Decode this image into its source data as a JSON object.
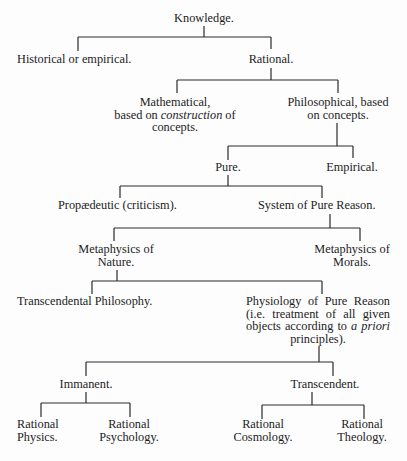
{
  "diagram": {
    "nodes": {
      "knowledge": {
        "lines": [
          "Knowledge."
        ]
      },
      "historical": {
        "lines": [
          "Historical or empirical."
        ]
      },
      "rational": {
        "lines": [
          "Rational."
        ]
      },
      "mathematical": {
        "line1": "Mathematical,",
        "line2_pre": "based on ",
        "line2_em": "construction",
        "line2_post": " of",
        "line3": "concepts."
      },
      "philosophical": {
        "lines": [
          "Philosophical, based",
          "on concepts."
        ]
      },
      "pure": {
        "lines": [
          "Pure."
        ]
      },
      "empirical": {
        "lines": [
          "Empirical."
        ]
      },
      "propaedeutic": {
        "lines": [
          "Propædeutic (criticism)."
        ]
      },
      "system": {
        "lines": [
          "System of Pure Reason."
        ]
      },
      "metaphysics_nature": {
        "lines": [
          "Metaphysics of",
          "Nature."
        ]
      },
      "metaphysics_morals": {
        "lines": [
          "Metaphysics of",
          "Morals."
        ]
      },
      "transcendental_philosophy": {
        "lines": [
          "Transcendental Philosophy."
        ]
      },
      "physiology": {
        "line1": "Physiology of Pure Reason",
        "line2": "(i.e. treatment of all given",
        "line3_pre": "objects according to ",
        "line3_em": "a priori",
        "line4": "principles)."
      },
      "immanent": {
        "lines": [
          "Immanent."
        ]
      },
      "transcendent": {
        "lines": [
          "Transcendent."
        ]
      },
      "rational_physics": {
        "lines": [
          "Rational",
          "Physics."
        ]
      },
      "rational_psychology": {
        "lines": [
          "Rational",
          "Psychology."
        ]
      },
      "rational_cosmology": {
        "lines": [
          "Rational",
          "Cosmology."
        ]
      },
      "rational_theology": {
        "lines": [
          "Rational",
          "Theology."
        ]
      }
    },
    "edges": [
      [
        "Knowledge.",
        "Historical or empirical."
      ],
      [
        "Knowledge.",
        "Rational."
      ],
      [
        "Rational.",
        "Mathematical"
      ],
      [
        "Rational.",
        "Philosophical"
      ],
      [
        "Philosophical",
        "Pure."
      ],
      [
        "Philosophical",
        "Empirical."
      ],
      [
        "Pure.",
        "Propædeutic (criticism)."
      ],
      [
        "Pure.",
        "System of Pure Reason."
      ],
      [
        "System of Pure Reason.",
        "Metaphysics of Nature."
      ],
      [
        "System of Pure Reason.",
        "Metaphysics of Morals."
      ],
      [
        "Metaphysics of Nature.",
        "Transcendental Philosophy."
      ],
      [
        "Metaphysics of Nature.",
        "Physiology of Pure Reason"
      ],
      [
        "Physiology of Pure Reason",
        "Immanent."
      ],
      [
        "Physiology of Pure Reason",
        "Transcendent."
      ],
      [
        "Immanent.",
        "Rational Physics."
      ],
      [
        "Immanent.",
        "Rational Psychology."
      ],
      [
        "Transcendent.",
        "Rational Cosmology."
      ],
      [
        "Transcendent.",
        "Rational Theology."
      ]
    ],
    "colors": {
      "background": "#fdfdfd",
      "text": "#1c1c1c",
      "line": "#2a2a2a"
    }
  }
}
